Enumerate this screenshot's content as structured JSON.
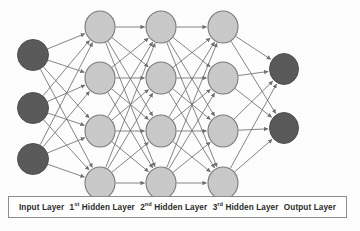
{
  "diagram": {
    "background_color": "#fdfdfd",
    "edge_color": "#6f6f6f",
    "input_node_fill": "#5a5a5a",
    "input_node_stroke": "#4a4a4a",
    "hidden_node_fill": "#c9c9c9",
    "hidden_node_stroke": "#7b7b7b",
    "output_node_fill": "#5a5a5a",
    "output_node_stroke": "#4a4a4a",
    "node_radius_x": 15,
    "node_radius_y": 15,
    "layers": [
      {
        "id": "input",
        "label": "Input Layer",
        "kind": "input",
        "node_count": 3,
        "x": 33,
        "node_y": [
          55,
          108,
          159
        ],
        "rx": 15.5,
        "ry": 15.5,
        "fill": "#5a5a5a",
        "stroke": "#4a4a4a"
      },
      {
        "id": "hidden1",
        "label": "1st Hidden Layer",
        "label_prefix": "1",
        "label_sup": "st",
        "label_rest": " Hidden Layer",
        "kind": "hidden",
        "node_count": 4,
        "x": 100,
        "node_y": [
          27,
          78,
          131,
          183
        ],
        "rx": 15,
        "ry": 16,
        "fill": "#c9c9c9",
        "stroke": "#7b7b7b"
      },
      {
        "id": "hidden2",
        "label": "2nd Hidden Layer",
        "label_prefix": "2",
        "label_sup": "nd",
        "label_rest": " Hidden Layer",
        "kind": "hidden",
        "node_count": 4,
        "x": 161,
        "node_y": [
          27,
          78,
          131,
          183
        ],
        "rx": 15,
        "ry": 16,
        "fill": "#c9c9c9",
        "stroke": "#7b7b7b"
      },
      {
        "id": "hidden3",
        "label": "3rd Hidden Layer",
        "label_prefix": "3",
        "label_sup": "rd",
        "label_rest": " Hidden Layer",
        "kind": "hidden",
        "node_count": 4,
        "x": 223,
        "node_y": [
          27,
          78,
          131,
          183
        ],
        "rx": 15,
        "ry": 16,
        "fill": "#c9c9c9",
        "stroke": "#7b7b7b"
      },
      {
        "id": "output",
        "label": "Output Layer",
        "kind": "output",
        "node_count": 2,
        "x": 284,
        "node_y": [
          69,
          128
        ],
        "rx": 14.5,
        "ry": 15.5,
        "fill": "#5a5a5a",
        "stroke": "#4a4a4a"
      }
    ],
    "connections": "fully-connected-between-adjacent-layers",
    "arrowheads": true,
    "legend": {
      "border_color": "#8d8d8d",
      "background": "#ffffff",
      "items": [
        {
          "text": "Input Layer",
          "prefix": "Input Layer",
          "sup": "",
          "rest": ""
        },
        {
          "text": "1st Hidden Layer",
          "prefix": "1",
          "sup": "st",
          "rest": " Hidden Layer"
        },
        {
          "text": "2nd Hidden Layer",
          "prefix": "2",
          "sup": "nd",
          "rest": " Hidden Layer"
        },
        {
          "text": "3rd Hidden Layer",
          "prefix": "3",
          "sup": "rd",
          "rest": " Hidden Layer"
        },
        {
          "text": "Output Layer",
          "prefix": "Output Layer",
          "sup": "",
          "rest": ""
        }
      ]
    }
  }
}
